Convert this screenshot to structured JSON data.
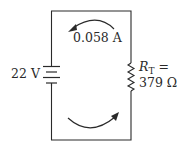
{
  "diagram": {
    "type": "series circuit",
    "source": {
      "label": "22 V",
      "voltage": "22 V"
    },
    "current": {
      "label": "0.058 A",
      "value": "0.058 A",
      "direction": "clockwise (arrows)"
    },
    "resistor": {
      "symbol": "R",
      "subscript": "T",
      "equals": "=",
      "value": "379 Ω"
    },
    "colors": {
      "line": "#2a2a2a",
      "background": "#ffffff"
    }
  }
}
